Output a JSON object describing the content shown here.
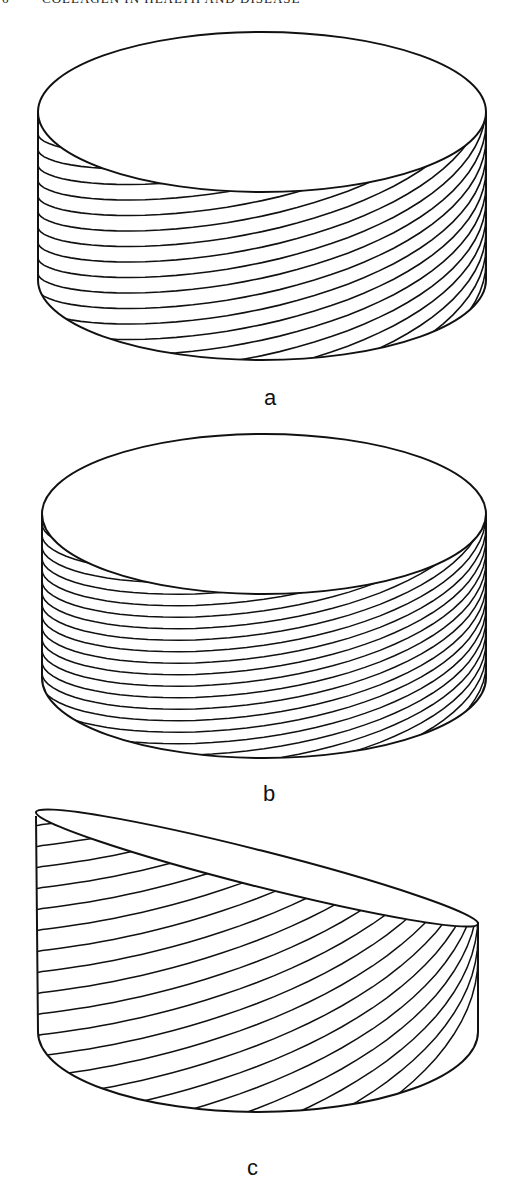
{
  "header": {
    "page_number": "6",
    "running_title": "COLLAGEN IN HEALTH AND DISEASE"
  },
  "figure": {
    "panels": [
      {
        "id": "a",
        "label": "a",
        "description": "Flat cylinder with helically wound fibres at a moderate pitch"
      },
      {
        "id": "b",
        "label": "b",
        "description": "Flat cylinder with densely wound, nearly horizontal helical fibres"
      },
      {
        "id": "c",
        "label": "c",
        "description": "Obliquely cut cylinder with steep helical fibres"
      }
    ],
    "line_color": "#111111",
    "background": "#ffffff"
  }
}
